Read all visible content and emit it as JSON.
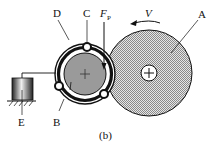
{
  "labels": {
    "A": "A",
    "B": "B",
    "C": "C",
    "D": "D",
    "E": "E",
    "force": "F",
    "force_sub": "P",
    "velocity": "V",
    "caption": "(b)"
  },
  "colors": {
    "wheel_fill": "#c8c8c8",
    "inner_wheel_fill": "#9a9a9a",
    "line": "#111111",
    "background": "#ffffff"
  }
}
